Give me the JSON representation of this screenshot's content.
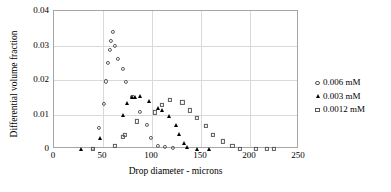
{
  "chart_data": {
    "type": "scatter",
    "title": "",
    "xlabel": "Drop diameter - microns",
    "ylabel": "Differential volume fraction",
    "xlim": [
      0,
      250
    ],
    "ylim": [
      0,
      0.04
    ],
    "xticks": [
      "0",
      "50",
      "100",
      "150",
      "200",
      "250"
    ],
    "xtick_values": [
      0,
      50,
      100,
      150,
      200,
      250
    ],
    "yticks": [
      "0",
      "0.01",
      "0.02",
      "0.03",
      "0.04"
    ],
    "ytick_values": [
      0,
      0.01,
      0.02,
      0.03,
      0.04
    ],
    "grid": "horizontal-and-vertical",
    "legend_position": "right",
    "marker_outline_color": "#595959",
    "marker_fill_color": "#000000",
    "series": [
      {
        "name": "0.006 mM",
        "marker": "open-circle",
        "points": [
          [
            40,
            0.0
          ],
          [
            46,
            0.006
          ],
          [
            51,
            0.013
          ],
          [
            53,
            0.0196
          ],
          [
            55,
            0.025
          ],
          [
            57,
            0.0288
          ],
          [
            58,
            0.0313
          ],
          [
            60,
            0.034
          ],
          [
            62,
            0.0299
          ],
          [
            65,
            0.0262
          ],
          [
            70,
            0.0231
          ],
          [
            73,
            0.0195
          ],
          [
            80,
            0.0152
          ],
          [
            88,
            0.0108
          ],
          [
            95,
            0.0069
          ],
          [
            99,
            0.0032
          ],
          [
            106,
            0.001
          ],
          [
            113,
            0.0006
          ],
          [
            121,
            0.0002
          ]
        ]
      },
      {
        "name": "0.003 mM",
        "marker": "filled-triangle",
        "points": [
          [
            28,
            0.0
          ],
          [
            47,
            0.0033
          ],
          [
            70,
            0.0098
          ],
          [
            74,
            0.0133
          ],
          [
            80,
            0.0152
          ],
          [
            83,
            0.0152
          ],
          [
            88,
            0.0154
          ],
          [
            97,
            0.0139
          ],
          [
            106,
            0.0119
          ],
          [
            110,
            0.0114
          ],
          [
            117,
            0.0096
          ],
          [
            124,
            0.007
          ],
          [
            128,
            0.0043
          ],
          [
            133,
            0.0016
          ],
          [
            136,
            0.0007
          ],
          [
            146,
            0.0001
          ],
          [
            158,
            0.0001
          ]
        ]
      },
      {
        "name": "0.0012 mM",
        "marker": "open-square",
        "points": [
          [
            40,
            0.0
          ],
          [
            62,
            0.0008
          ],
          [
            70,
            0.0035
          ],
          [
            72,
            0.0041
          ],
          [
            85,
            0.008
          ],
          [
            103,
            0.0106
          ],
          [
            110,
            0.0128
          ],
          [
            118,
            0.0143
          ],
          [
            131,
            0.0135
          ],
          [
            139,
            0.0112
          ],
          [
            146,
            0.0089
          ],
          [
            155,
            0.0067
          ],
          [
            162,
            0.0041
          ],
          [
            172,
            0.0022
          ],
          [
            182,
            0.0008
          ],
          [
            190,
            0.0001
          ],
          [
            206,
            0.0001
          ],
          [
            217,
            0.0001
          ],
          [
            224,
            0.0001
          ]
        ]
      }
    ]
  }
}
